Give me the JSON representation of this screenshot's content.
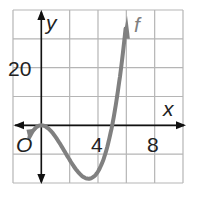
{
  "chart_data": {
    "type": "line",
    "title": "",
    "xlabel": "x",
    "ylabel": "y",
    "origin_label": "O",
    "x_ticks": [
      {
        "value": 4,
        "label": "4"
      },
      {
        "value": 8,
        "label": "8"
      }
    ],
    "y_ticks": [
      {
        "value": 20,
        "label": "20"
      }
    ],
    "xlim": [
      -2,
      10
    ],
    "ylim": [
      -20,
      40
    ],
    "grid": true,
    "grid_step": {
      "x": 2,
      "y": 10
    },
    "series": [
      {
        "name": "f",
        "label": "f",
        "function": "x^2(x-5)",
        "color": "#808080",
        "points": [
          [
            -0.7,
            -2.8
          ],
          [
            0,
            0
          ],
          [
            1,
            -4
          ],
          [
            2,
            -12
          ],
          [
            3,
            -18
          ],
          [
            3.33,
            -18.5
          ],
          [
            4,
            -16
          ],
          [
            5,
            0
          ],
          [
            5.5,
            15.1
          ],
          [
            6,
            36
          ]
        ]
      }
    ]
  },
  "colors": {
    "grid": "#b5b5b5",
    "axis": "#111111",
    "curve": "#808080"
  }
}
